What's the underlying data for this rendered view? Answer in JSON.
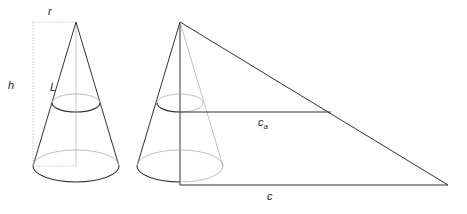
{
  "diagram": {
    "labels": {
      "radius": "r",
      "height": "h",
      "slant": "L",
      "partial_circumference": "c",
      "partial_circumference_sub": "a",
      "circumference": "c"
    },
    "colors": {
      "solid_line": "#333333",
      "hidden_line": "#b0b0b0",
      "dotted_guide": "#b8b8b8"
    }
  }
}
